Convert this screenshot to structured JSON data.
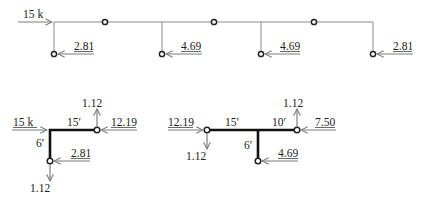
{
  "top_frame": {
    "applied_load": "15 k",
    "reactions": [
      "2.81",
      "4.69",
      "4.69",
      "2.81"
    ]
  },
  "free_body_left": {
    "horizontal_load": "15 k",
    "beam_length": "15′",
    "column_height": "6′",
    "top_vertical": "1.12",
    "right_horizontal": "12.19",
    "base_horizontal": "2.81",
    "base_vertical": "1.12"
  },
  "free_body_right": {
    "left_horizontal": "12.19",
    "left_vertical": "1.12",
    "beam_left_length": "15′",
    "beam_right_length": "10′",
    "column_height": "6′",
    "right_vertical": "1.12",
    "right_horizontal": "7.50",
    "base_horizontal": "4.69"
  },
  "colors": {
    "member": "#8a8a8a",
    "thick_member": "#111111",
    "arrow": "#7d7d7d"
  }
}
